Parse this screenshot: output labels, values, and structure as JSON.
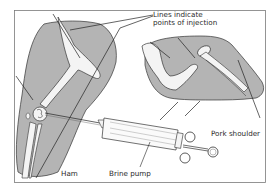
{
  "figure": {
    "labels": {
      "injection_lines_line1": "Lines indicate",
      "injection_lines_line2": "points of injection",
      "ham": "Ham",
      "brine_pump": "Brine pump",
      "pork_shoulder": "Pork shoulder"
    },
    "colors": {
      "meat_fill": "#b4b4b4",
      "bone_fill": "#f4f4f4",
      "outline": "#2b2b2b",
      "frame": "#7a7a7a",
      "background": "#ffffff"
    },
    "parts": [
      "ham",
      "pork-shoulder",
      "brine-pump"
    ]
  }
}
